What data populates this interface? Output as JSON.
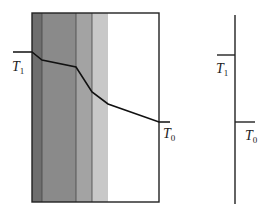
{
  "diagram": {
    "left_panel": {
      "box": {
        "x": 32,
        "y": 13,
        "w": 127,
        "h": 189
      },
      "layers": [
        {
          "name": "layer-1",
          "x0": 32,
          "x1": 42,
          "fill": "#6e6e6e"
        },
        {
          "name": "layer-2",
          "x0": 42,
          "x1": 76,
          "fill": "#8a8a8a"
        },
        {
          "name": "layer-3",
          "x0": 76,
          "x1": 92,
          "fill": "#a3a3a3"
        },
        {
          "name": "layer-4",
          "x0": 92,
          "x1": 108,
          "fill": "#c8c8c8"
        },
        {
          "name": "layer-5",
          "x0": 108,
          "x1": 159,
          "fill": "#ffffff"
        }
      ],
      "temperature_profile": [
        [
          13,
          52
        ],
        [
          32,
          52
        ],
        [
          42,
          60
        ],
        [
          76,
          67
        ],
        [
          92,
          92
        ],
        [
          108,
          104
        ],
        [
          159,
          122
        ],
        [
          170,
          122
        ]
      ],
      "label_t1": {
        "base": "T",
        "sub": "1"
      },
      "label_t0": {
        "base": "T",
        "sub": "0"
      }
    },
    "right_panel": {
      "label_t1": {
        "base": "T",
        "sub": "1"
      },
      "label_t0": {
        "base": "T",
        "sub": "0"
      }
    }
  }
}
